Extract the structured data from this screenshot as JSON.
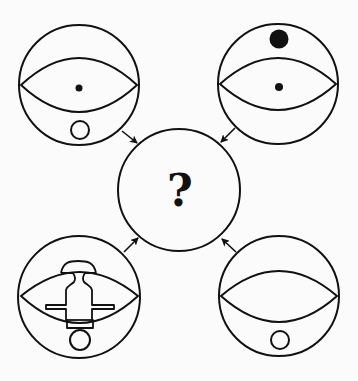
{
  "puzzle": {
    "type": "visual-reasoning-figure-combination",
    "center": {
      "label": "?",
      "cx": 179,
      "cy": 190,
      "r": 61
    },
    "panels": [
      {
        "id": "top-left",
        "circle": {
          "cx": 79,
          "cy": 85,
          "r": 60
        },
        "eye": {
          "left": 21,
          "right": 137,
          "y": 85,
          "top": 58,
          "bottom": 112
        },
        "inner_dot": {
          "cx": 79,
          "cy": 88,
          "r": 3.5
        },
        "top_dot": null,
        "bottom_ring": {
          "cx": 80,
          "cy": 130,
          "r": 9
        },
        "arrow": {
          "x1": 122,
          "y1": 131,
          "x2": 137,
          "y2": 143
        }
      },
      {
        "id": "top-right",
        "circle": {
          "cx": 278,
          "cy": 84,
          "r": 60
        },
        "eye": {
          "left": 220,
          "right": 336,
          "y": 84,
          "top": 58,
          "bottom": 110
        },
        "inner_dot": {
          "cx": 279,
          "cy": 87,
          "r": 4
        },
        "top_dot": {
          "cx": 279,
          "cy": 39,
          "r": 9.5
        },
        "bottom_ring": null,
        "arrow": {
          "x1": 235,
          "y1": 128,
          "x2": 221,
          "y2": 142
        }
      },
      {
        "id": "bottom-left",
        "circle": {
          "cx": 79,
          "cy": 297,
          "r": 61
        },
        "eye": {
          "left": 21,
          "right": 138,
          "y": 296,
          "top": 272,
          "bottom": 323
        },
        "inner_dot": null,
        "top_dot": null,
        "bottom_ring": {
          "cx": 80,
          "cy": 340,
          "r": 10
        },
        "robot_shape": true,
        "arrow": {
          "x1": 124,
          "y1": 252,
          "x2": 138,
          "y2": 238
        }
      },
      {
        "id": "bottom-right",
        "circle": {
          "cx": 279,
          "cy": 296,
          "r": 60
        },
        "eye": {
          "left": 221,
          "right": 337,
          "y": 296,
          "top": 271,
          "bottom": 322
        },
        "inner_dot": null,
        "top_dot": null,
        "bottom_ring": {
          "cx": 280,
          "cy": 340,
          "r": 9
        },
        "arrow": {
          "x1": 236,
          "y1": 252,
          "x2": 222,
          "y2": 239
        }
      }
    ],
    "colors": {
      "stroke": "#111111",
      "background": "#fbfbfb"
    }
  }
}
